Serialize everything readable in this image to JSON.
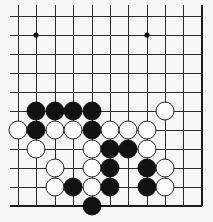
{
  "board": {
    "title": "Go problem diagram (lower-right corner view)",
    "colors": {
      "background": "#f6f6f4",
      "line": "#2a2a2a",
      "black_stone": "#111111",
      "white_stone": "#fdfdfb"
    },
    "grid": {
      "columns_x": [
        18,
        36,
        55,
        73,
        92,
        110,
        128,
        147,
        165,
        183,
        202
      ],
      "rows_y": [
        16,
        35,
        54,
        73,
        92,
        111,
        130,
        149,
        168,
        187,
        206
      ],
      "left_start_x": 10,
      "top_start_y": 5,
      "right_edge": true,
      "bottom_edge": true
    },
    "star_points": [
      {
        "col": 1,
        "row": 1
      },
      {
        "col": 7,
        "row": 1
      }
    ],
    "stones": [
      {
        "color": "black",
        "col": 1,
        "row": 5
      },
      {
        "color": "black",
        "col": 2,
        "row": 5
      },
      {
        "color": "black",
        "col": 3,
        "row": 5
      },
      {
        "color": "black",
        "col": 4,
        "row": 5
      },
      {
        "color": "white",
        "col": 8,
        "row": 5
      },
      {
        "color": "white",
        "col": 0,
        "row": 6
      },
      {
        "color": "black",
        "col": 1,
        "row": 6
      },
      {
        "color": "white",
        "col": 2,
        "row": 6
      },
      {
        "color": "white",
        "col": 3,
        "row": 6
      },
      {
        "color": "black",
        "col": 4,
        "row": 6
      },
      {
        "color": "white",
        "col": 5,
        "row": 6
      },
      {
        "color": "white",
        "col": 6,
        "row": 6
      },
      {
        "color": "white",
        "col": 7,
        "row": 6
      },
      {
        "color": "white",
        "col": 1,
        "row": 7
      },
      {
        "color": "white",
        "col": 4,
        "row": 7
      },
      {
        "color": "black",
        "col": 5,
        "row": 7
      },
      {
        "color": "black",
        "col": 6,
        "row": 7
      },
      {
        "color": "white",
        "col": 7,
        "row": 7
      },
      {
        "color": "white",
        "col": 2,
        "row": 8
      },
      {
        "color": "white",
        "col": 4,
        "row": 8
      },
      {
        "color": "black",
        "col": 5,
        "row": 8
      },
      {
        "color": "black",
        "col": 7,
        "row": 8
      },
      {
        "color": "white",
        "col": 8,
        "row": 8
      },
      {
        "color": "white",
        "col": 2,
        "row": 9
      },
      {
        "color": "black",
        "col": 3,
        "row": 9
      },
      {
        "color": "white",
        "col": 4,
        "row": 9
      },
      {
        "color": "black",
        "col": 5,
        "row": 9
      },
      {
        "color": "black",
        "col": 7,
        "row": 9
      },
      {
        "color": "white",
        "col": 8,
        "row": 9
      },
      {
        "color": "black",
        "col": 4,
        "row": 10
      }
    ],
    "stone_radius": 9
  }
}
